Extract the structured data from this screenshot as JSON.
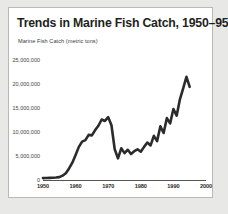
{
  "figure": {
    "title": "Trends in Marine Fish Catch, 1950–95",
    "subtitle": "Marine Fish Catch (metric tons)",
    "background_color": "#e8e8e6",
    "panel_color": "#ffffff",
    "border_color": "#b9b9b5",
    "line_color": "#2b2b2b",
    "axis_color": "#555555"
  },
  "chart_data": {
    "type": "line",
    "title": "Trends in Marine Fish Catch, 1950–95",
    "subtitle": "Marine Fish Catch (metric tons)",
    "xlabel": "",
    "ylabel": "Marine Fish Catch (metric tons)",
    "xlim": [
      1950,
      2000
    ],
    "ylim": [
      0,
      25000000
    ],
    "grid": false,
    "legend": false,
    "legend_position": "none",
    "xticks": [
      1950,
      1960,
      1970,
      1980,
      1990,
      2000
    ],
    "xtick_labels": [
      "1950",
      "1960",
      "1970",
      "1980",
      "1990",
      "2000"
    ],
    "yticks": [
      0,
      5000000,
      10000000,
      15000000,
      20000000,
      25000000
    ],
    "ytick_labels": [
      "0",
      "5,000,000",
      "10,000,000",
      "15,000,000",
      "20,000,000",
      "25,000,000"
    ],
    "series": [
      {
        "name": "Marine Fish Catch",
        "color": "#2b2b2b",
        "x": [
          1950,
          1951,
          1952,
          1953,
          1954,
          1955,
          1956,
          1957,
          1958,
          1959,
          1960,
          1961,
          1962,
          1963,
          1964,
          1965,
          1966,
          1967,
          1968,
          1969,
          1970,
          1971,
          1972,
          1973,
          1974,
          1975,
          1976,
          1977,
          1978,
          1979,
          1980,
          1981,
          1982,
          1983,
          1984,
          1985,
          1986,
          1987,
          1988,
          1989,
          1990,
          1991,
          1992,
          1993,
          1994,
          1995
        ],
        "values": [
          400000,
          420000,
          450000,
          480000,
          520000,
          600000,
          900000,
          1400000,
          2400000,
          3600000,
          5200000,
          6900000,
          8000000,
          8300000,
          9400000,
          9300000,
          10400000,
          11300000,
          12600000,
          12300000,
          13100000,
          11400000,
          6400000,
          4500000,
          6600000,
          5600000,
          6300000,
          5400000,
          6000000,
          6400000,
          5900000,
          6900000,
          7800000,
          7200000,
          9200000,
          8100000,
          11200000,
          9800000,
          12900000,
          11800000,
          14800000,
          13400000,
          16800000,
          19100000,
          21500000,
          19400000
        ]
      }
    ],
    "annotations": [
      {
        "label": "peak",
        "x": 1970,
        "y": 13100000
      },
      {
        "label": "trough",
        "x": 1973,
        "y": 4500000
      },
      {
        "label": "maximum",
        "x": 1994,
        "y": 21500000
      }
    ]
  }
}
